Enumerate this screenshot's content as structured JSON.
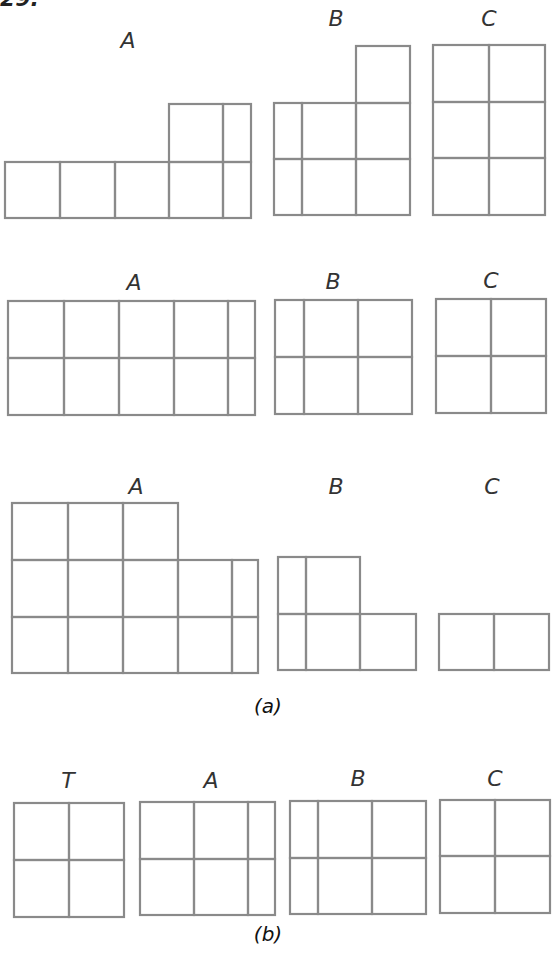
{
  "problem_number": "29.",
  "line_color": "#8a8a8a",
  "parts": [
    {
      "caption": "(a)",
      "rows": [
        {
          "labels": [
            "A",
            "B",
            "C"
          ]
        },
        {
          "labels": [
            "A",
            "B",
            "C"
          ]
        },
        {
          "labels": [
            "A",
            "B",
            "C"
          ]
        }
      ]
    },
    {
      "caption": "(b)",
      "rows": [
        {
          "labels": [
            "T",
            "A",
            "B",
            "C"
          ]
        }
      ]
    }
  ],
  "figures": [
    {
      "id": "a-row1-A",
      "label": "A",
      "cells": [
        [
          5,
          162,
          60,
          218
        ],
        [
          60,
          162,
          115,
          218
        ],
        [
          115,
          162,
          169,
          218
        ],
        [
          169,
          162,
          223,
          218
        ],
        [
          223,
          162,
          251,
          218
        ],
        [
          169,
          104,
          223,
          162
        ],
        [
          223,
          104,
          251,
          162
        ]
      ]
    },
    {
      "id": "a-row1-B",
      "label": "B",
      "cells": [
        [
          356,
          46,
          410,
          103
        ],
        [
          274,
          103,
          302,
          159
        ],
        [
          302,
          103,
          356,
          159
        ],
        [
          356,
          103,
          410,
          159
        ],
        [
          274,
          159,
          302,
          215
        ],
        [
          302,
          159,
          356,
          215
        ],
        [
          356,
          159,
          410,
          215
        ]
      ]
    },
    {
      "id": "a-row1-C",
      "label": "C",
      "cells": [
        [
          433,
          45,
          489,
          102
        ],
        [
          489,
          45,
          545,
          102
        ],
        [
          433,
          102,
          489,
          158
        ],
        [
          489,
          102,
          545,
          158
        ],
        [
          433,
          158,
          489,
          215
        ],
        [
          489,
          158,
          545,
          215
        ]
      ]
    },
    {
      "id": "a-row2-A",
      "label": "A",
      "cells": [
        [
          8,
          301,
          64,
          358
        ],
        [
          64,
          301,
          119,
          358
        ],
        [
          119,
          301,
          174,
          358
        ],
        [
          174,
          301,
          228,
          358
        ],
        [
          228,
          301,
          255,
          358
        ],
        [
          8,
          358,
          64,
          415
        ],
        [
          64,
          358,
          119,
          415
        ],
        [
          119,
          358,
          174,
          415
        ],
        [
          174,
          358,
          228,
          415
        ],
        [
          228,
          358,
          255,
          415
        ]
      ]
    },
    {
      "id": "a-row2-B",
      "label": "B",
      "cells": [
        [
          275,
          300,
          304,
          357
        ],
        [
          304,
          300,
          358,
          357
        ],
        [
          358,
          300,
          412,
          357
        ],
        [
          275,
          357,
          304,
          414
        ],
        [
          304,
          357,
          358,
          414
        ],
        [
          358,
          357,
          412,
          414
        ]
      ]
    },
    {
      "id": "a-row2-C",
      "label": "C",
      "cells": [
        [
          436,
          299,
          491,
          356
        ],
        [
          491,
          299,
          546,
          356
        ],
        [
          436,
          356,
          491,
          413
        ],
        [
          491,
          356,
          546,
          413
        ]
      ]
    },
    {
      "id": "a-row3-A",
      "label": "A",
      "cells": [
        [
          12,
          503,
          68,
          560
        ],
        [
          68,
          503,
          123,
          560
        ],
        [
          123,
          503,
          178,
          560
        ],
        [
          12,
          560,
          68,
          617
        ],
        [
          68,
          560,
          123,
          617
        ],
        [
          123,
          560,
          178,
          617
        ],
        [
          178,
          560,
          232,
          617
        ],
        [
          232,
          560,
          258,
          617
        ],
        [
          12,
          617,
          68,
          673
        ],
        [
          68,
          617,
          123,
          673
        ],
        [
          123,
          617,
          178,
          673
        ],
        [
          178,
          617,
          232,
          673
        ],
        [
          232,
          617,
          258,
          673
        ]
      ]
    },
    {
      "id": "a-row3-B",
      "label": "B",
      "cells": [
        [
          278,
          557,
          306,
          614
        ],
        [
          306,
          557,
          360,
          614
        ],
        [
          278,
          614,
          306,
          670
        ],
        [
          306,
          614,
          360,
          670
        ],
        [
          360,
          614,
          416,
          670
        ]
      ]
    },
    {
      "id": "a-row3-C",
      "label": "C",
      "cells": [
        [
          439,
          614,
          494,
          670
        ],
        [
          494,
          614,
          549,
          670
        ]
      ]
    },
    {
      "id": "b-T",
      "label": "T",
      "cells": [
        [
          14,
          803,
          69,
          860
        ],
        [
          69,
          803,
          124,
          860
        ],
        [
          14,
          860,
          69,
          917
        ],
        [
          69,
          860,
          124,
          917
        ]
      ]
    },
    {
      "id": "b-A",
      "label": "A",
      "cells": [
        [
          140,
          802,
          194,
          859
        ],
        [
          194,
          802,
          248,
          859
        ],
        [
          248,
          802,
          275,
          859
        ],
        [
          140,
          859,
          194,
          915
        ],
        [
          194,
          859,
          248,
          915
        ],
        [
          248,
          859,
          275,
          915
        ]
      ]
    },
    {
      "id": "b-B",
      "label": "B",
      "cells": [
        [
          290,
          801,
          318,
          858
        ],
        [
          318,
          801,
          372,
          858
        ],
        [
          372,
          801,
          426,
          858
        ],
        [
          290,
          858,
          318,
          914
        ],
        [
          318,
          858,
          372,
          914
        ],
        [
          372,
          858,
          426,
          914
        ]
      ]
    },
    {
      "id": "b-C",
      "label": "C",
      "cells": [
        [
          440,
          800,
          495,
          856
        ],
        [
          495,
          800,
          550,
          856
        ],
        [
          440,
          856,
          495,
          913
        ],
        [
          495,
          856,
          550,
          913
        ]
      ]
    }
  ]
}
